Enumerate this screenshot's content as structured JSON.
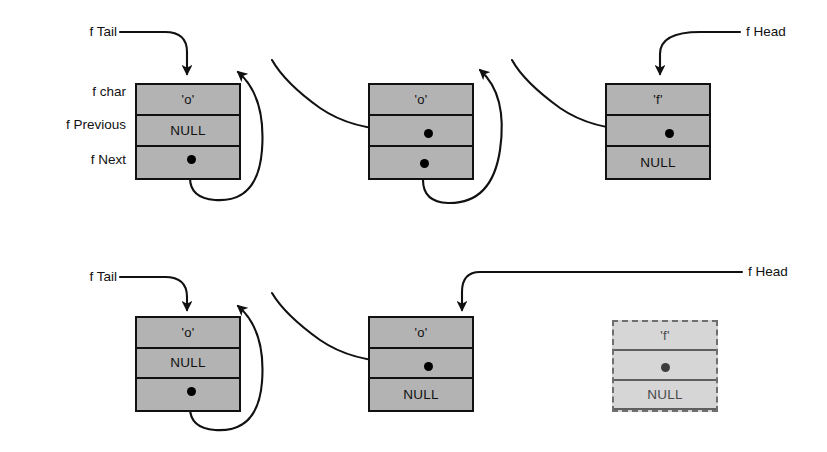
{
  "figure": {
    "background_color": "#ffffff",
    "node_fill": "#b3b3b3",
    "ghost_node_fill": "#d6d6d6",
    "stroke_color": "#111111"
  },
  "row_labels": {
    "char": "f char",
    "previous": "f Previous",
    "next": "f Next"
  },
  "pointer_labels": {
    "tail": "f Tail",
    "head": "f Head"
  },
  "diagrams": [
    {
      "name": "before-deletion",
      "nodes": [
        {
          "id": "top-node-1",
          "char": "'o'",
          "previous": "NULL",
          "next": "",
          "previous_is_pointer": false,
          "next_is_pointer": true,
          "ghost": false
        },
        {
          "id": "top-node-2",
          "char": "'o'",
          "previous": "",
          "next": "",
          "previous_is_pointer": true,
          "next_is_pointer": true,
          "ghost": false
        },
        {
          "id": "top-node-3",
          "char": "'f'",
          "previous": "",
          "next": "NULL",
          "previous_is_pointer": true,
          "next_is_pointer": false,
          "ghost": false
        }
      ],
      "tail_points_to": "top-node-1",
      "head_points_to": "top-node-3"
    },
    {
      "name": "after-deletion",
      "nodes": [
        {
          "id": "bottom-node-1",
          "char": "'o'",
          "previous": "NULL",
          "next": "",
          "previous_is_pointer": false,
          "next_is_pointer": true,
          "ghost": false
        },
        {
          "id": "bottom-node-2",
          "char": "'o'",
          "previous": "",
          "next": "NULL",
          "previous_is_pointer": true,
          "next_is_pointer": false,
          "ghost": false
        },
        {
          "id": "bottom-node-3",
          "char": "'f'",
          "previous": "",
          "next": "NULL",
          "previous_is_pointer": true,
          "next_is_pointer": false,
          "ghost": true
        }
      ],
      "tail_points_to": "bottom-node-1",
      "head_points_to": "bottom-node-2"
    }
  ]
}
